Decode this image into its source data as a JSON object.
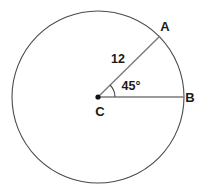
{
  "figure": {
    "type": "circle-with-central-angle",
    "background_color": "#ffffff",
    "stroke_color": "#4a4a4a",
    "radius_stroke_color": "#6b6b6b",
    "text_color": "#1a1a1a",
    "circle": {
      "center_x": 98,
      "center_y": 97,
      "radius_px": 86
    },
    "center_point": {
      "label": "C",
      "label_x": 100,
      "label_y": 116
    },
    "point_a": {
      "label": "A",
      "label_x": 165,
      "label_y": 31,
      "x": 159,
      "y": 36
    },
    "point_b": {
      "label": "B",
      "label_x": 188,
      "label_y": 102,
      "x": 184,
      "y": 97
    },
    "radius_measure": {
      "label": "12",
      "label_x": 111,
      "label_y": 63
    },
    "central_angle": {
      "label": "45°",
      "label_x": 118,
      "label_y": 90,
      "degrees": 45,
      "arc_radius_px": 17
    }
  }
}
